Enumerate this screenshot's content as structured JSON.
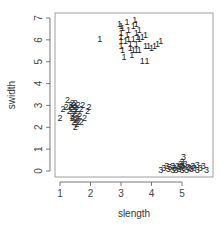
{
  "chart_data": {
    "type": "scatter",
    "title": "",
    "xlabel": "slength",
    "ylabel": "swidth",
    "xlim": [
      0.85,
      6.0
    ],
    "ylim": [
      -0.3,
      7.2
    ],
    "xticks": [
      1,
      2,
      3,
      4,
      5
    ],
    "yticks": [
      0,
      1,
      2,
      3,
      4,
      5,
      6,
      7
    ],
    "grid": false,
    "legend": "none",
    "marker": "text-label",
    "series": [
      {
        "name": "1",
        "label": "1",
        "points": [
          [
            2.3,
            6.0
          ],
          [
            2.95,
            6.7
          ],
          [
            3.0,
            6.6
          ],
          [
            3.05,
            6.5
          ],
          [
            3.0,
            6.3
          ],
          [
            3.0,
            6.1
          ],
          [
            3.0,
            5.9
          ],
          [
            3.0,
            5.7
          ],
          [
            3.05,
            5.5
          ],
          [
            3.1,
            5.2
          ],
          [
            3.2,
            6.8
          ],
          [
            3.2,
            6.2
          ],
          [
            3.25,
            6.0
          ],
          [
            3.3,
            5.8
          ],
          [
            3.3,
            5.6
          ],
          [
            3.4,
            6.6
          ],
          [
            3.4,
            6.0
          ],
          [
            3.4,
            5.5
          ],
          [
            3.45,
            6.9
          ],
          [
            3.5,
            6.7
          ],
          [
            3.5,
            6.3
          ],
          [
            3.5,
            5.8
          ],
          [
            3.5,
            5.5
          ],
          [
            3.6,
            6.4
          ],
          [
            3.6,
            6.0
          ],
          [
            3.6,
            5.5
          ],
          [
            3.7,
            6.1
          ],
          [
            3.7,
            5.0
          ],
          [
            3.8,
            6.2
          ],
          [
            3.8,
            5.7
          ],
          [
            3.85,
            5.0
          ],
          [
            3.9,
            5.7
          ],
          [
            4.0,
            5.6
          ],
          [
            4.1,
            5.7
          ],
          [
            4.2,
            5.8
          ],
          [
            4.3,
            5.9
          ],
          [
            3.35,
            5.3
          ],
          [
            3.15,
            5.9
          ],
          [
            3.55,
            6.1
          ],
          [
            3.25,
            6.4
          ]
        ]
      },
      {
        "name": "2",
        "label": "2",
        "points": [
          [
            1.0,
            2.4
          ],
          [
            1.1,
            2.8
          ],
          [
            1.2,
            2.9
          ],
          [
            1.25,
            3.2
          ],
          [
            1.3,
            2.7
          ],
          [
            1.35,
            2.9
          ],
          [
            1.35,
            3.0
          ],
          [
            1.4,
            2.5
          ],
          [
            1.4,
            2.8
          ],
          [
            1.4,
            3.1
          ],
          [
            1.45,
            2.2
          ],
          [
            1.45,
            2.6
          ],
          [
            1.5,
            2.0
          ],
          [
            1.5,
            2.3
          ],
          [
            1.5,
            2.7
          ],
          [
            1.5,
            2.9
          ],
          [
            1.5,
            3.1
          ],
          [
            1.55,
            2.4
          ],
          [
            1.55,
            2.8
          ],
          [
            1.6,
            2.2
          ],
          [
            1.6,
            2.6
          ],
          [
            1.6,
            3.0
          ],
          [
            1.65,
            2.5
          ],
          [
            1.7,
            2.2
          ],
          [
            1.7,
            2.8
          ],
          [
            1.75,
            3.0
          ],
          [
            1.8,
            2.4
          ],
          [
            1.9,
            2.7
          ],
          [
            1.95,
            2.9
          ],
          [
            1.45,
            3.0
          ],
          [
            1.55,
            2.1
          ],
          [
            1.4,
            2.4
          ]
        ]
      },
      {
        "name": "3",
        "label": "3",
        "points": [
          [
            4.3,
            0.0
          ],
          [
            4.4,
            0.1
          ],
          [
            4.5,
            0.2
          ],
          [
            4.55,
            0.05
          ],
          [
            4.6,
            0.15
          ],
          [
            4.7,
            0.0
          ],
          [
            4.7,
            0.2
          ],
          [
            4.75,
            0.1
          ],
          [
            4.8,
            0.0
          ],
          [
            4.85,
            0.2
          ],
          [
            4.9,
            0.05
          ],
          [
            4.9,
            0.15
          ],
          [
            5.0,
            0.0
          ],
          [
            5.0,
            0.2
          ],
          [
            5.0,
            0.4
          ],
          [
            5.05,
            0.6
          ],
          [
            5.05,
            0.1
          ],
          [
            5.1,
            0.3
          ],
          [
            5.15,
            0.0
          ],
          [
            5.2,
            0.15
          ],
          [
            5.3,
            0.05
          ],
          [
            5.35,
            0.2
          ],
          [
            5.4,
            0.1
          ],
          [
            5.5,
            0.0
          ],
          [
            5.5,
            0.25
          ],
          [
            5.6,
            0.1
          ],
          [
            5.7,
            0.2
          ],
          [
            5.8,
            0.0
          ],
          [
            4.95,
            0.3
          ],
          [
            5.25,
            0.1
          ]
        ]
      }
    ]
  }
}
